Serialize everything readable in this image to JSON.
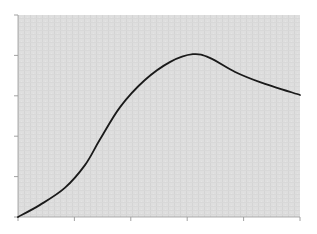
{
  "chart_data": {
    "type": "line",
    "title": "",
    "xlabel": "",
    "ylabel": "",
    "xlim": [
      0,
      5
    ],
    "ylim": [
      0,
      5
    ],
    "x_ticks": [
      0,
      1,
      2,
      3,
      4,
      5
    ],
    "y_ticks": [
      0,
      1,
      2,
      3,
      4,
      5
    ],
    "x_tick_labels": [
      "",
      "",
      "",
      "",
      "",
      ""
    ],
    "y_tick_labels": [
      "",
      "",
      "",
      "",
      "",
      ""
    ],
    "grid": false,
    "legend": "none",
    "colors": {
      "plot_background": "#dcdcdc",
      "line": "#1a1a1a",
      "axis": "#9a9a9a"
    },
    "series": [
      {
        "name": "curve",
        "x": [
          0,
          0.39,
          0.83,
          1.19,
          1.45,
          1.81,
          2.25,
          2.7,
          3.1,
          3.4,
          3.85,
          4.29,
          5.0
        ],
        "y": [
          0,
          0.3,
          0.72,
          1.29,
          1.91,
          2.72,
          3.39,
          3.84,
          4.03,
          3.94,
          3.59,
          3.34,
          3.02
        ]
      }
    ]
  }
}
